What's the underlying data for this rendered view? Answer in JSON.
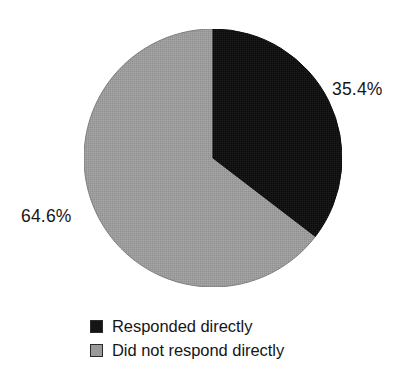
{
  "figure": {
    "name": "pie-chart-response-rates",
    "background_color": "#ffffff"
  },
  "chart_data": {
    "type": "pie",
    "title": "",
    "subtitle": "",
    "xlabel": "",
    "ylabel": "",
    "grid": false,
    "legend_position": "bottom",
    "start_angle_deg": 0,
    "direction": "clockwise",
    "total_percent": 100.0,
    "categories": [
      "Responded directly",
      "Did not respond directly"
    ],
    "values": [
      35.4,
      64.6
    ],
    "value_unit": "%",
    "data_labels": [
      "35.4%",
      "64.6%"
    ],
    "slice_colors": [
      "#151515",
      "#9a9a9a"
    ],
    "slices": [
      {
        "label": "Responded directly",
        "value": 35.4,
        "data_label": "35.4%",
        "color": "#151515",
        "start_angle_deg": 0,
        "end_angle_deg": 127.44,
        "label_position": "right"
      },
      {
        "label": "Did not respond directly",
        "value": 64.6,
        "data_label": "64.6%",
        "color": "#9a9a9a",
        "start_angle_deg": 127.44,
        "end_angle_deg": 360,
        "label_position": "left"
      }
    ]
  },
  "labels": {
    "right_percent": "35.4%",
    "left_percent": "64.6%"
  },
  "legend": {
    "items": [
      {
        "swatch_name": "legend-swatch-responded",
        "color": "#151515",
        "label": "Responded directly"
      },
      {
        "swatch_name": "legend-swatch-did-not-respond",
        "color": "#9a9a9a",
        "label": "Did not respond directly"
      }
    ]
  }
}
